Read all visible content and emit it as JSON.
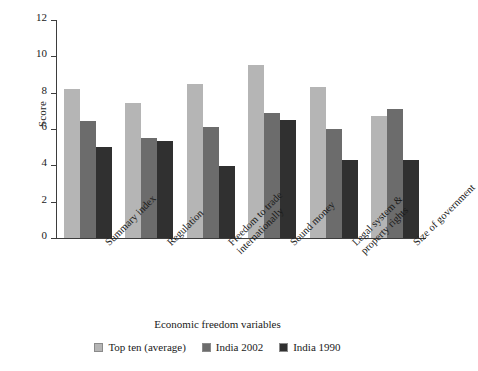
{
  "chart_data": {
    "type": "bar",
    "title": "",
    "xlabel": "Economic freedom variables",
    "ylabel": "Score",
    "ylim": [
      0,
      12
    ],
    "yticks": [
      0,
      2,
      4,
      6,
      8,
      10,
      12
    ],
    "grid": false,
    "legend_position": "bottom",
    "categories": [
      "Summary index",
      "Regulation",
      "Freedom to trade internationally",
      "Sound money",
      "Legal system & property rights",
      "Size of government"
    ],
    "category_lines": [
      [
        "Summary index"
      ],
      [
        "Regulation"
      ],
      [
        "Freedom to trade",
        "internationally"
      ],
      [
        "Sound money"
      ],
      [
        "Legal system &",
        "property rights"
      ],
      [
        "Size of government"
      ]
    ],
    "series": [
      {
        "name": "Top ten (average)",
        "color": "#b5b5b5",
        "values": [
          8.2,
          7.45,
          8.5,
          9.55,
          8.3,
          6.7
        ]
      },
      {
        "name": "India 2002",
        "color": "#6c6c6c",
        "values": [
          6.45,
          5.5,
          6.1,
          6.9,
          6.0,
          7.1
        ]
      },
      {
        "name": "India 1990",
        "color": "#303030",
        "values": [
          5.0,
          5.35,
          3.95,
          6.5,
          4.3,
          4.3
        ]
      }
    ]
  }
}
